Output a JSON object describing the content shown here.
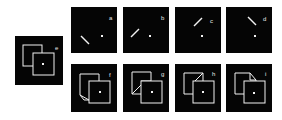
{
  "figure": {
    "background": "#ffffff",
    "panel_color": "#050505",
    "stroke_color": "#f2f2f2",
    "panels": [
      {
        "id": "e",
        "label": "e",
        "kind": "two-squares-plain"
      },
      {
        "id": "a",
        "label": "a",
        "kind": "line-and-dot",
        "line": "lower-left-descending"
      },
      {
        "id": "b",
        "label": "b",
        "kind": "line-and-dot",
        "line": "lower-left-ascending"
      },
      {
        "id": "c",
        "label": "c",
        "kind": "line-and-dot",
        "line": "upper-right-ascending"
      },
      {
        "id": "d",
        "label": "d",
        "kind": "line-and-dot",
        "line": "upper-right-descending"
      },
      {
        "id": "f",
        "label": "f",
        "kind": "two-squares",
        "variant": "lower-left-fold"
      },
      {
        "id": "g",
        "label": "g",
        "kind": "two-squares",
        "variant": "lower-left-cut"
      },
      {
        "id": "h",
        "label": "h",
        "kind": "two-squares",
        "variant": "upper-right-cut"
      },
      {
        "id": "i",
        "label": "i",
        "kind": "two-squares",
        "variant": "upper-right-fold"
      }
    ]
  }
}
